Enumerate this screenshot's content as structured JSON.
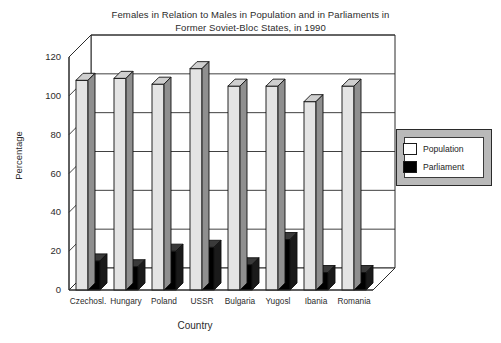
{
  "chart_data": {
    "type": "bar",
    "title": "Females in Relation to Males in Population and in Parliaments in Former Soviet-Bloc States, in 1990",
    "title_line1": "Females in Relation to Males in Population and in Parliaments in",
    "title_line2": "Former Soviet-Bloc States, in 1990",
    "xlabel": "Country",
    "ylabel": "Percentage",
    "ylim": [
      0,
      120
    ],
    "yticks": [
      0,
      20,
      40,
      60,
      80,
      100,
      120
    ],
    "grid": true,
    "legend_position": "right",
    "style": "3d-bar",
    "categories": [
      "Czechosl.",
      "Hungary",
      "Poland",
      "USSR",
      "Bulgaria",
      "Yugosl",
      "Ibania",
      "Romania"
    ],
    "series": [
      {
        "name": "Population",
        "color": "#e4e4e4",
        "values": [
          108,
          109,
          106,
          114,
          105,
          105,
          97,
          105
        ]
      },
      {
        "name": "Parliament",
        "color": "#000000",
        "values": [
          15,
          12,
          20,
          22,
          13,
          26,
          9,
          9
        ]
      }
    ]
  },
  "legend": {
    "items": [
      {
        "label": "Population",
        "swatch": "population-swatch"
      },
      {
        "label": "Parliament",
        "swatch": "parliament-swatch"
      }
    ]
  }
}
